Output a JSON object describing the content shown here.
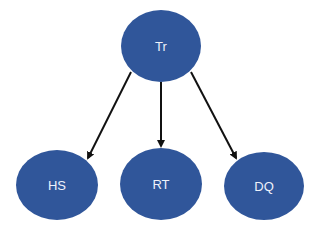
{
  "diagram": {
    "type": "tree",
    "colors": {
      "node_fill": "#30569a",
      "node_text": "#eef2fa",
      "edge": "#111111",
      "background": "#ffffff"
    },
    "nodes": [
      {
        "id": "tr",
        "label": "Tr",
        "cx": 161,
        "cy": 46,
        "rx": 40,
        "ry": 36
      },
      {
        "id": "hs",
        "label": "HS",
        "cx": 57,
        "cy": 185,
        "rx": 41,
        "ry": 35
      },
      {
        "id": "rt",
        "label": "RT",
        "cx": 161,
        "cy": 184,
        "rx": 41,
        "ry": 36
      },
      {
        "id": "dq",
        "label": "DQ",
        "cx": 264,
        "cy": 186,
        "rx": 40,
        "ry": 34
      }
    ],
    "edges": [
      {
        "from": "tr",
        "to": "hs"
      },
      {
        "from": "tr",
        "to": "rt"
      },
      {
        "from": "tr",
        "to": "dq"
      }
    ]
  }
}
